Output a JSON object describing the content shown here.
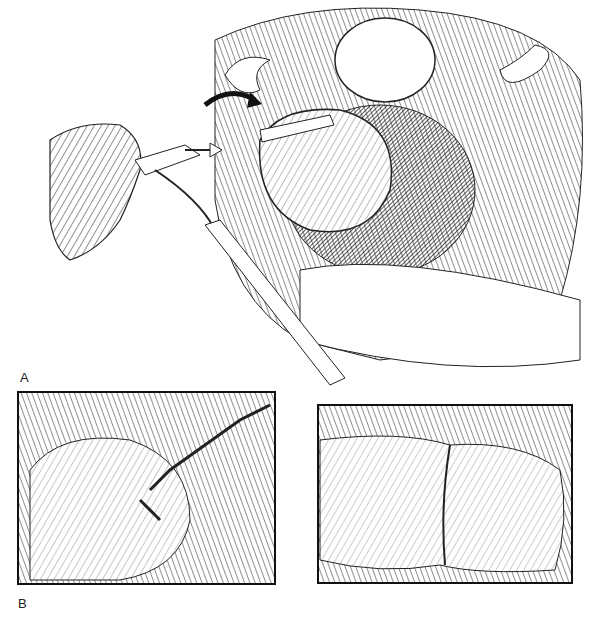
{
  "figure": {
    "labels": {
      "panel_a": "A",
      "panel_b": "B"
    },
    "panels": [
      {
        "id": "A",
        "description": "Instrument held by hand grasping tissue, arrow indicating movement toward organ"
      },
      {
        "id": "B-left",
        "description": "Close-up of instrument clamping tissue"
      },
      {
        "id": "B-right",
        "description": "Close-up of tissue after procedure"
      }
    ],
    "colors": {
      "ink": "#1a1a1a",
      "background": "#ffffff"
    }
  }
}
